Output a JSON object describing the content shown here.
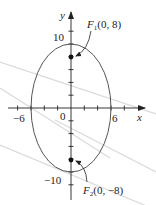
{
  "figure": {
    "type": "ellipse-diagram",
    "axes": {
      "x_label": "x",
      "y_label": "y",
      "x_ticks": [
        {
          "value": -6,
          "label": "−6"
        },
        {
          "value": 0,
          "label": "0"
        },
        {
          "value": 6,
          "label": "6"
        }
      ],
      "y_ticks": [
        {
          "value": 10,
          "label": "10"
        },
        {
          "value": -10,
          "label": "−10"
        }
      ],
      "x_minor_tick_step": 2,
      "y_minor_tick_step": 2
    },
    "ellipse": {
      "center": [
        0,
        0
      ],
      "semi_axis_x": 6,
      "semi_axis_y": 10,
      "color": "#555555"
    },
    "foci": [
      {
        "name": "F1",
        "label_prefix": "F",
        "label_sub": "1",
        "label_coords": "(0, 8)",
        "x": 0,
        "y": 8
      },
      {
        "name": "F2",
        "label_prefix": "F",
        "label_sub": "2",
        "label_coords": "(0, −8)",
        "x": 0,
        "y": -8
      }
    ],
    "colors": {
      "axis": "#222222",
      "ellipse": "#555555",
      "focus_dot": "#111111",
      "background_lines": "#d8d8d8"
    }
  }
}
